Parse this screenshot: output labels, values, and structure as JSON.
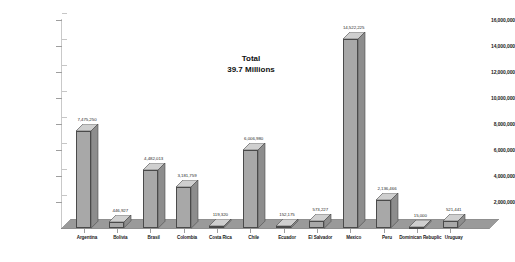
{
  "chart_data": {
    "type": "bar",
    "title": "",
    "subtitle": "",
    "xlabel": "",
    "ylabel": "",
    "ylim": [
      0,
      16000000
    ],
    "grid": false,
    "legend": "none",
    "style": "3d-column",
    "categories": [
      "Argentina",
      "Bolivia",
      "Brasil",
      "Colombia",
      "Costa Rica",
      "Chile",
      "Ecuador",
      "El Salvador",
      "Mexico",
      "Peru",
      "Dominican Rebuplic",
      "Uruguay"
    ],
    "values": [
      7475250,
      446927,
      4482013,
      3181759,
      119320,
      6006980,
      152175,
      573227,
      14522225,
      2136466,
      15000,
      521441
    ],
    "value_labels": [
      "7,475,250",
      "446,927",
      "4,482,013",
      "3,181,759",
      "119,320",
      "6,006,980",
      "152,175",
      "573,227",
      "14,522,225",
      "2,136,466",
      "15,000",
      "521,441"
    ],
    "yticks": [
      16000000,
      14000000,
      12000000,
      10000000,
      8000000,
      6000000,
      4000000,
      2000000
    ],
    "ytick_labels": [
      "16,000,000",
      "14,000,000",
      "12,000,000",
      "10,000,000",
      "8,000,000",
      "6,000,000",
      "4,000,000",
      "2,000,000"
    ],
    "annotations": [
      {
        "text_line_1": "Total",
        "text_line_2": "39.7 Millions"
      }
    ]
  },
  "annotation": {
    "line1": "Total",
    "line2": "39.7 Millions"
  },
  "colors": {
    "bar_front": "#a8a8a8",
    "bar_top": "#cfcfcf",
    "bar_side": "#8d8d8d",
    "bar_outline": "#4a4a4a",
    "floor": "#9a9a9a",
    "axis": "#b9b9b9",
    "text": "#1a1a1a",
    "background": "#ffffff"
  }
}
